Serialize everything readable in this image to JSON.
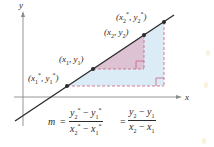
{
  "diagram": {
    "axes": {
      "x_label": "x",
      "y_label": "y"
    },
    "points": [
      {
        "id": "p1_star",
        "label_x": "x",
        "label_x_sub": "1",
        "label_sup": "*",
        "label_y": "y",
        "label_y_sub": "1"
      },
      {
        "id": "p1",
        "label_x": "x",
        "label_x_sub": "1",
        "label_y": "y",
        "label_y_sub": "1"
      },
      {
        "id": "p2",
        "label_x": "x",
        "label_x_sub": "2",
        "label_y": "y",
        "label_y_sub": "2"
      },
      {
        "id": "p2_star",
        "label_x": "x",
        "label_x_sub": "2",
        "label_sup": "*",
        "label_y": "y",
        "label_y_sub": "2"
      }
    ],
    "formula": {
      "lhs": "m",
      "equals": "=",
      "frac1": {
        "num_a": "y",
        "num_a_sub": "2",
        "num_a_sup": "*",
        "minus": "−",
        "num_b": "y",
        "num_b_sub": "1",
        "num_b_sup": "*",
        "den_a": "x",
        "den_a_sub": "2",
        "den_a_sup": "*",
        "den_b": "x",
        "den_b_sub": "1",
        "den_b_sup": "*"
      },
      "frac2": {
        "num_a": "y",
        "num_a_sub": "2",
        "minus": "−",
        "num_b": "y",
        "num_b_sub": "1",
        "den_a": "x",
        "den_a_sub": "2",
        "den_b": "x",
        "den_b_sub": "1"
      }
    },
    "colors": {
      "line": "#2b2b2b",
      "axis": "#8a8a8a",
      "small_triangle_fill": "#dcc2d3",
      "large_triangle_fill": "#dcecf6",
      "dashed": "#c8607e",
      "point": "#2b2b2b"
    }
  }
}
